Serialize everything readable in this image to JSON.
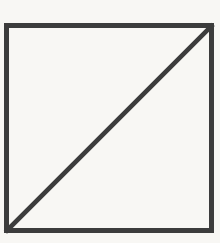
{
  "figure": {
    "background_color": "#f8f7f4",
    "stroke_color": "#3c3c3c",
    "square": {
      "x": "6.5",
      "y": "25.5",
      "width": "205",
      "height": "205",
      "stroke_width": "5"
    },
    "diagonal": {
      "x1": "7",
      "y1": "230.5",
      "x2": "211.5",
      "y2": "26",
      "stroke_width": "4.6"
    }
  }
}
